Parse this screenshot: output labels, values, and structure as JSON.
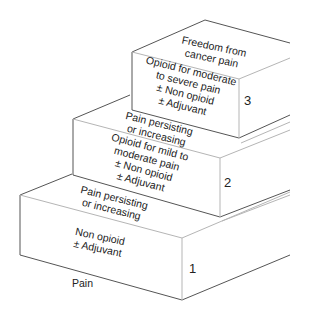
{
  "diagram": {
    "colors": {
      "line": "#555555",
      "light_line": "#b5b5b5",
      "text": "#222222",
      "background": "#ffffff"
    },
    "start_label": "Pain",
    "goal_label": [
      "Freedom from",
      "cancer pain"
    ],
    "steps": [
      {
        "number": "1",
        "treatment": [
          "Non opioid",
          "± Adjuvant"
        ],
        "transition": [
          "Pain persisting",
          "or increasing"
        ]
      },
      {
        "number": "2",
        "treatment": [
          "Opioid for mild to",
          "moderate pain",
          "± Non opioid",
          "± Adjuvant"
        ],
        "transition": [
          "Pain persisting",
          "or increasing"
        ]
      },
      {
        "number": "3",
        "treatment": [
          "Opioid for moderate",
          "to severe pain",
          "± Non opioid",
          "± Adjuvant"
        ]
      }
    ]
  }
}
